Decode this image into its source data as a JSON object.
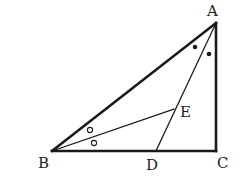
{
  "diagram": {
    "type": "geometry-figure",
    "colors": {
      "stroke": "#1a1a1a",
      "label": "#222222",
      "background": "#ffffff"
    },
    "points": {
      "A": {
        "label": "A",
        "x": 216,
        "y": 23,
        "label_x": 207,
        "label_y": 16
      },
      "B": {
        "label": "B",
        "x": 52,
        "y": 151,
        "label_x": 38,
        "label_y": 168
      },
      "C": {
        "label": "C",
        "x": 216,
        "y": 151,
        "label_x": 217,
        "label_y": 168
      },
      "D": {
        "label": "D",
        "x": 156,
        "y": 151,
        "label_x": 146,
        "label_y": 170
      },
      "E": {
        "label": "E",
        "x": 174,
        "y": 109,
        "label_x": 180,
        "label_y": 117
      }
    },
    "segments": [
      {
        "from": "A",
        "to": "B",
        "weight": "thick"
      },
      {
        "from": "B",
        "to": "C",
        "weight": "thick"
      },
      {
        "from": "C",
        "to": "A",
        "weight": "thick"
      },
      {
        "from": "A",
        "to": "D",
        "weight": "thin"
      },
      {
        "from": "B",
        "to": "E",
        "weight": "thin"
      }
    ],
    "angle_marks": [
      {
        "vertex": "A",
        "symbol": "filled-dot",
        "x": 195,
        "y": 47
      },
      {
        "vertex": "A",
        "symbol": "filled-dot",
        "x": 209,
        "y": 54
      },
      {
        "vertex": "B",
        "symbol": "open-circle",
        "x": 90,
        "y": 130
      },
      {
        "vertex": "B",
        "symbol": "open-circle",
        "x": 94,
        "y": 143
      }
    ],
    "labels": [
      "A",
      "B",
      "C",
      "D",
      "E"
    ]
  }
}
